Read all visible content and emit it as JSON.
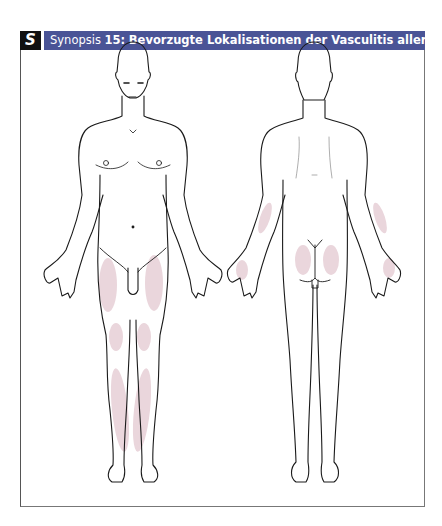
{
  "header": {
    "badge": "S",
    "prefix": "Synopsis ",
    "number": "15:",
    "title": "Bevorzugte Lokalisationen der Vasculitis allergica",
    "bar_color": "#4a5496"
  },
  "figures": [
    {
      "view": "anterior",
      "label": "front view",
      "highlighted_regions": [
        "left thigh",
        "right thigh",
        "left knee",
        "right knee",
        "left shin",
        "right shin"
      ]
    },
    {
      "view": "posterior",
      "label": "back view",
      "highlighted_regions": [
        "left forearm",
        "right forearm",
        "left buttock",
        "right buttock",
        "left hand dorsum",
        "right hand dorsum"
      ]
    }
  ],
  "highlight_color": "#ead6dc"
}
